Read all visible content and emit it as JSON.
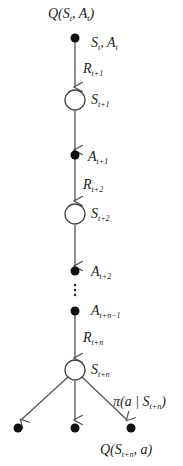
{
  "diagram": {
    "colors": {
      "line": "#555555",
      "node_fill": "#111111",
      "open_fill": "#ffffff"
    },
    "top_label": {
      "main": "Q(S",
      "sub1": "t",
      "mid": ", A",
      "sub2": "t",
      "end": ")"
    },
    "nodes": [
      {
        "id": "n1",
        "type": "action",
        "label_main": "S",
        "label_sub": "t",
        "label_extra": ", A",
        "label_extra_sub": "t"
      },
      {
        "id": "n2",
        "type": "state",
        "label_main": "S",
        "label_sub": "t+1"
      },
      {
        "id": "n3",
        "type": "action",
        "label_main": "A",
        "label_sub": "t+1"
      },
      {
        "id": "n4",
        "type": "state",
        "label_main": "S",
        "label_sub": "t+2"
      },
      {
        "id": "n5",
        "type": "action",
        "label_main": "A",
        "label_sub": "t+2"
      },
      {
        "id": "n6",
        "type": "action",
        "label_main": "A",
        "label_sub": "t+n−1"
      },
      {
        "id": "n7",
        "type": "state",
        "label_main": "S",
        "label_sub": "t+n"
      },
      {
        "id": "leaf1",
        "type": "action"
      },
      {
        "id": "leaf2",
        "type": "action"
      },
      {
        "id": "leaf3",
        "type": "action"
      }
    ],
    "edges": [
      {
        "from": "n1",
        "to": "n2",
        "label_main": "R",
        "label_sub": "t+1"
      },
      {
        "from": "n2",
        "to": "n3"
      },
      {
        "from": "n3",
        "to": "n4",
        "label_main": "R",
        "label_sub": "t+2"
      },
      {
        "from": "n4",
        "to": "n5"
      },
      {
        "from": "n6",
        "to": "n7",
        "label_main": "R",
        "label_sub": "t+n"
      },
      {
        "from": "n7",
        "to": "leaf1"
      },
      {
        "from": "n7",
        "to": "leaf2"
      },
      {
        "from": "n7",
        "to": "leaf3"
      }
    ],
    "ellipsis": "⋮",
    "policy_label": {
      "main": "π(a | S",
      "sub": "t+n",
      "end": ")"
    },
    "bottom_label": {
      "main": "Q(S",
      "sub": "t+n",
      "end": ", a)"
    }
  }
}
